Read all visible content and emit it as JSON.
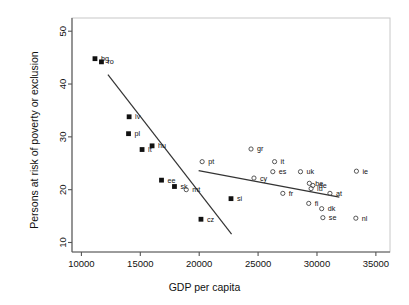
{
  "chart_data": {
    "type": "scatter",
    "title": "",
    "xlabel": "GDP per capita",
    "ylabel": "Persons at risk of poverty or exclusion",
    "xlim": [
      9200,
      36200
    ],
    "ylim": [
      8.2,
      52.5
    ],
    "xticks": [
      10000,
      15000,
      20000,
      25000,
      30000,
      35000
    ],
    "xtick_labels": [
      "10000",
      "15000",
      "20000",
      "25000",
      "30000",
      "35000"
    ],
    "yticks": [
      10,
      20,
      30,
      40,
      50
    ],
    "ytick_labels": [
      "10",
      "20",
      "30",
      "40",
      "50"
    ],
    "grid": false,
    "legend": "none",
    "series": [
      {
        "name": "new-member-states",
        "marker": "filled-square",
        "points": [
          {
            "label": "bg",
            "x": 11150,
            "y": 44.8,
            "lx": 6,
            "ly": 2.5
          },
          {
            "label": "ro",
            "x": 11700,
            "y": 44.2,
            "lx": 6,
            "ly": 2.5
          },
          {
            "label": "lv",
            "x": 14050,
            "y": 33.8,
            "lx": 6,
            "ly": 2.5
          },
          {
            "label": "pl",
            "x": 14000,
            "y": 30.6,
            "lx": 6,
            "ly": 2.5
          },
          {
            "label": "lt",
            "x": 15150,
            "y": 27.6,
            "lx": 6,
            "ly": 2.5
          },
          {
            "label": "hu",
            "x": 16000,
            "y": 28.3,
            "lx": 6,
            "ly": 2.5
          },
          {
            "label": "ee",
            "x": 16800,
            "y": 21.8,
            "lx": 6,
            "ly": 2.5
          },
          {
            "label": "sk",
            "x": 17900,
            "y": 20.6,
            "lx": 6,
            "ly": 2.5
          },
          {
            "label": "si",
            "x": 22700,
            "y": 18.3,
            "lx": 6,
            "ly": 2.5
          },
          {
            "label": "cz",
            "x": 20150,
            "y": 14.4,
            "lx": 6,
            "ly": 2.5
          }
        ],
        "fit_line": {
          "x1": 12250,
          "y1": 41.8,
          "x2": 22750,
          "y2": 11.6
        }
      },
      {
        "name": "old-member-states",
        "marker": "open-circle",
        "points": [
          {
            "label": "pt",
            "x": 20250,
            "y": 25.3,
            "lx": 6,
            "ly": 2.5
          },
          {
            "label": "gr",
            "x": 24400,
            "y": 27.7,
            "lx": 6,
            "ly": 2.5
          },
          {
            "label": "mt",
            "x": 18900,
            "y": 20.0,
            "lx": 6,
            "ly": 2.5
          },
          {
            "label": "it",
            "x": 26400,
            "y": 25.3,
            "lx": 6,
            "ly": 2.5
          },
          {
            "label": "es",
            "x": 26250,
            "y": 23.4,
            "lx": 6,
            "ly": 2.5
          },
          {
            "label": "cy",
            "x": 24650,
            "y": 22.2,
            "lx": 6,
            "ly": 2.5
          },
          {
            "label": "uk",
            "x": 28600,
            "y": 23.4,
            "lx": 6,
            "ly": 2.5
          },
          {
            "label": "fr",
            "x": 27100,
            "y": 19.3,
            "lx": 6,
            "ly": 2.5
          },
          {
            "label": "be",
            "x": 29350,
            "y": 21.2,
            "lx": 6,
            "ly": 2.4
          },
          {
            "label": "de",
            "x": 29650,
            "y": 20.8,
            "lx": 6,
            "ly": 2.4
          },
          {
            "label": "lu",
            "x": 29500,
            "y": 20.2,
            "lx": 6,
            "ly": 2.4
          },
          {
            "label": "at",
            "x": 31100,
            "y": 19.3,
            "lx": 6,
            "ly": 2.5
          },
          {
            "label": "fi",
            "x": 29300,
            "y": 17.4,
            "lx": 6,
            "ly": 2.5
          },
          {
            "label": "dk",
            "x": 30400,
            "y": 16.4,
            "lx": 6,
            "ly": 2.5
          },
          {
            "label": "se",
            "x": 30500,
            "y": 14.7,
            "lx": 6,
            "ly": 2.5
          },
          {
            "label": "nl",
            "x": 33300,
            "y": 14.6,
            "lx": 6,
            "ly": 2.5
          },
          {
            "label": "ie",
            "x": 33350,
            "y": 23.5,
            "lx": 6,
            "ly": 2.5
          }
        ],
        "fit_line": {
          "x1": 19950,
          "y1": 23.6,
          "x2": 31900,
          "y2": 18.6
        }
      }
    ]
  }
}
